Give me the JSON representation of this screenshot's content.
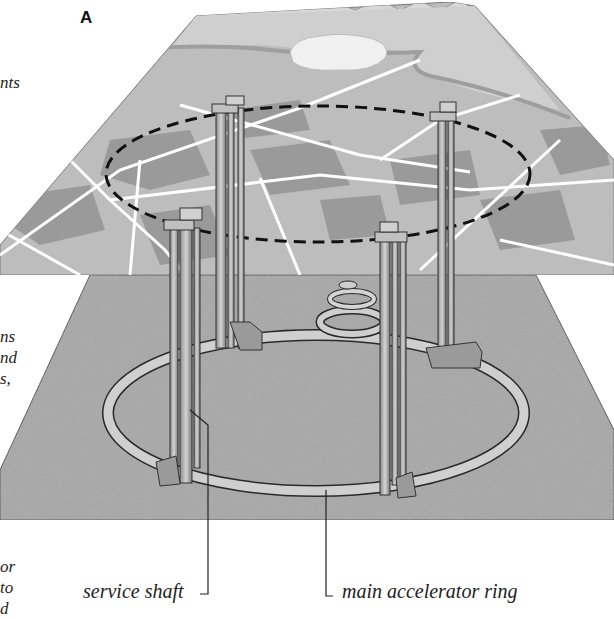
{
  "figure": {
    "panel_label": "A",
    "labels": {
      "service_shaft": "service shaft",
      "main_ring": "main accelerator ring"
    },
    "cut_off_text": {
      "top": [
        "nts"
      ],
      "middle": [
        "ns",
        "nd",
        "s,"
      ],
      "bottom": [
        "or",
        "to",
        "d"
      ]
    },
    "layers": {
      "surface": "surface landscape with mountains, river, cloud/lake, roads and land parcels",
      "underground": "granular rock plane with accelerator ring, shafts and injector rings"
    },
    "colors": {
      "surface_gray": "#b8b8b8",
      "surface_dark_parcel": "#8e8e8e",
      "road_white": "#ffffff",
      "rock_gray": "#a9a9a9",
      "ring_fill": "#c9c9c9",
      "outline": "#2a2a2a",
      "dashed_boundary": "#111111"
    }
  }
}
